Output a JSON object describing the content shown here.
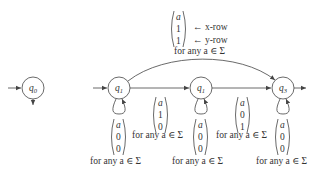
{
  "diagram": {
    "type": "finite-automaton",
    "states": [
      {
        "id": "s0",
        "label": "q",
        "sub": "0",
        "initial": true,
        "cx": 33,
        "cy": 88
      },
      {
        "id": "s1",
        "label": "q",
        "sub": "1",
        "initial": true,
        "cx": 119,
        "cy": 88
      },
      {
        "id": "s2",
        "label": "q",
        "sub": "1",
        "initial": false,
        "cx": 201,
        "cy": 88
      },
      {
        "id": "s3",
        "label": "q",
        "sub": "3",
        "initial": false,
        "accepting": true,
        "cx": 283,
        "cy": 88
      }
    ],
    "top_edge": {
      "from": "s1",
      "to": "s3",
      "vector": [
        "a",
        "1",
        "1"
      ],
      "row_notes": [
        "← x-row",
        "← y-row"
      ],
      "caption": "for any a ∈ Σ"
    },
    "edges": [
      {
        "from": "s1",
        "to": "s2",
        "vector": [
          "a",
          "1",
          "0"
        ],
        "caption": "for any a ∈ Σ"
      },
      {
        "from": "s2",
        "to": "s3",
        "vector": [
          "a",
          "0",
          "1"
        ],
        "caption": "for any a ∈ Σ"
      }
    ],
    "self_loops": [
      {
        "state": "s1",
        "vector": [
          "a",
          "0",
          "0"
        ],
        "caption": "for any a ∈ Σ"
      },
      {
        "state": "s2",
        "vector": [
          "a",
          "0",
          "0"
        ],
        "caption": "for any a ∈ Σ"
      },
      {
        "state": "s3",
        "vector": [
          "a",
          "0",
          "0"
        ],
        "caption": "for any a ∈ Σ"
      }
    ]
  }
}
